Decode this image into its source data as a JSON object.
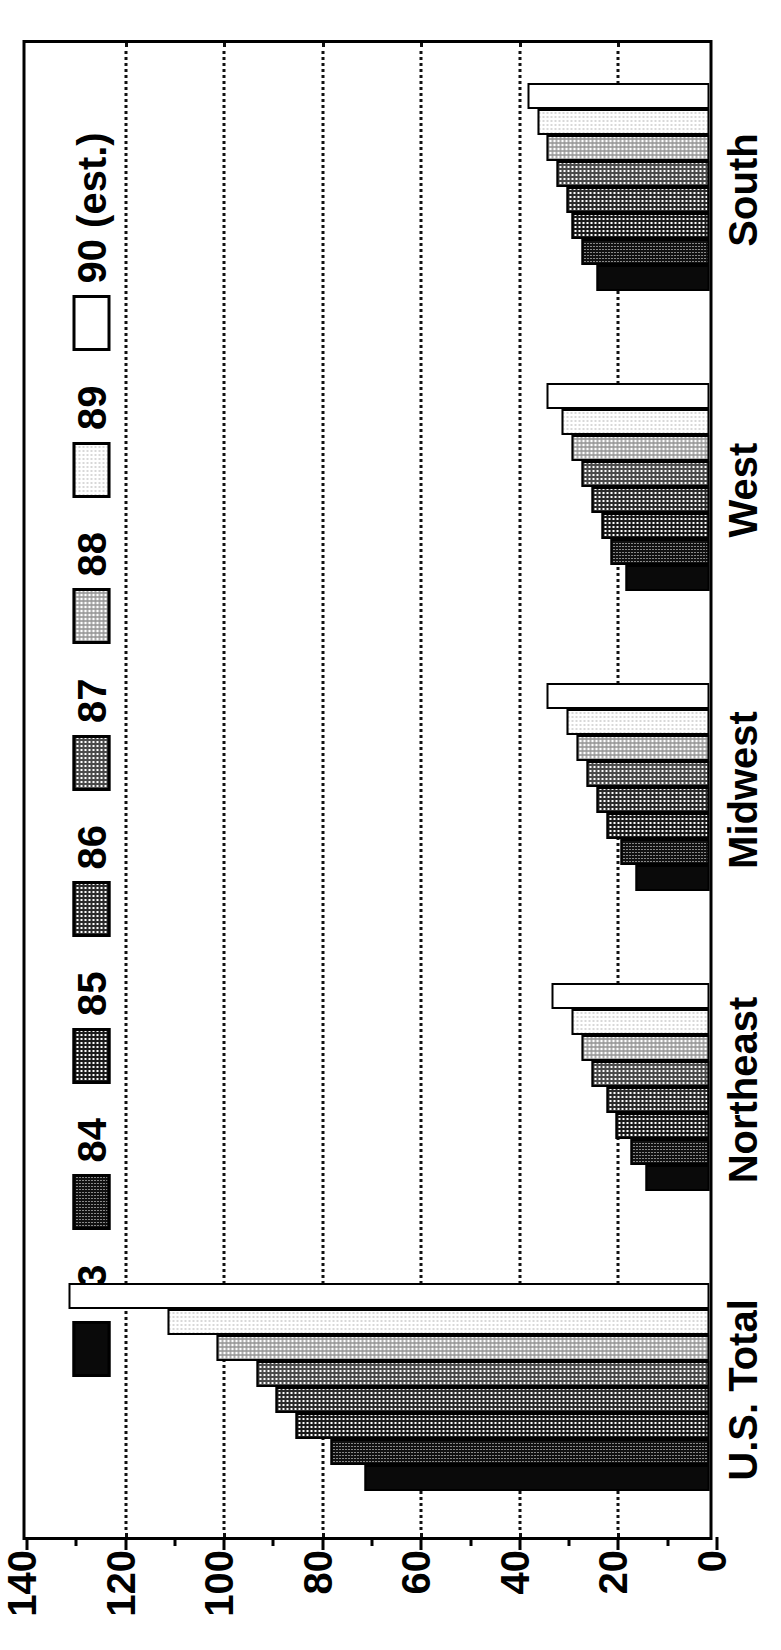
{
  "chart_data": {
    "type": "bar",
    "title": "",
    "subtitle": "",
    "xlabel": "",
    "ylabel": "",
    "orientation": "vertical-grouped",
    "grid": true,
    "gridlines_at": [
      20,
      40,
      60,
      80,
      100,
      120
    ],
    "legend_position": "top",
    "ylim": [
      0,
      140
    ],
    "yticks": [
      0,
      20,
      40,
      60,
      80,
      100,
      120,
      140
    ],
    "yticklabels": [
      "0",
      "20",
      "40",
      "60",
      "80",
      "100",
      "120",
      "140"
    ],
    "minor_tick_interval": 10,
    "categories": [
      "U.S. Total",
      "Northeast",
      "Midwest",
      "West",
      "South"
    ],
    "series": [
      {
        "name": "83",
        "pattern": "solid",
        "values": [
          70,
          13,
          15,
          17,
          23
        ]
      },
      {
        "name": "84",
        "pattern": "fine95",
        "values": [
          77,
          16,
          18,
          20,
          26
        ]
      },
      {
        "name": "85",
        "pattern": "cross70",
        "values": [
          84,
          19,
          21,
          22,
          28
        ]
      },
      {
        "name": "86",
        "pattern": "cross55",
        "values": [
          88,
          21,
          23,
          24,
          29
        ]
      },
      {
        "name": "87",
        "pattern": "mid",
        "values": [
          92,
          24,
          25,
          26,
          31
        ]
      },
      {
        "name": "88",
        "pattern": "light",
        "values": [
          100,
          26,
          27,
          28,
          33
        ]
      },
      {
        "name": "89",
        "pattern": "vlight",
        "values": [
          110,
          28,
          29,
          30,
          35
        ]
      },
      {
        "name": "90 (est.)",
        "pattern": "white",
        "values": [
          130,
          32,
          33,
          33,
          37
        ]
      }
    ]
  },
  "legend": {
    "items": [
      {
        "label": "83",
        "pattern": "solid"
      },
      {
        "label": "84",
        "pattern": "fine95"
      },
      {
        "label": "85",
        "pattern": "cross70"
      },
      {
        "label": "86",
        "pattern": "cross55"
      },
      {
        "label": "87",
        "pattern": "mid"
      },
      {
        "label": "88",
        "pattern": "light"
      },
      {
        "label": "89",
        "pattern": "vlight"
      },
      {
        "label": "90 (est.)",
        "pattern": "white"
      }
    ]
  },
  "colors": {
    "axis": "#000000",
    "grid": "#111111",
    "background": "#ffffff"
  }
}
